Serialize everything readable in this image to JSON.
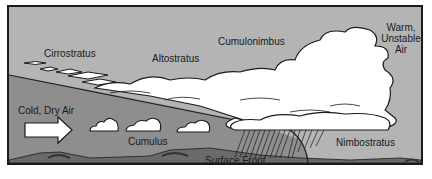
{
  "diagram": {
    "type": "warm-front-cross-section",
    "labels": {
      "cirrostratus": "Cirrostratus",
      "altostratus": "Altostratus",
      "cumulonimbus": "Cumulonimbus",
      "warm_air_line1": "Warm,",
      "warm_air_line2": "Unstable",
      "warm_air_line3": "Air",
      "cold_air": "Cold, Dry Air",
      "cumulus": "Cumulus",
      "nimbostratus": "Nimbostratus",
      "surface_front": "Surface Front"
    },
    "colors": {
      "sky": "#b4b4b4",
      "cold_wedge": "#8c8c8c",
      "ground": "#6e6e6e",
      "cloud": "#ffffff",
      "outline": "#1a1a1a"
    }
  }
}
